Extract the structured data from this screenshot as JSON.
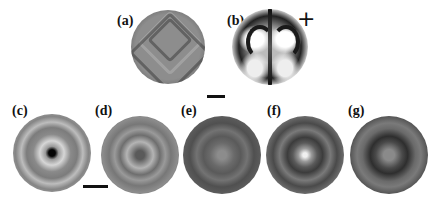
{
  "figure": {
    "panels": [
      {
        "id": "a",
        "label": "(a)",
        "description": "gray disc with nested diamond/chevron fringe pattern"
      },
      {
        "id": "b",
        "label": "(b)",
        "description": "high-contrast black and white disc with symmetric lobes",
        "marker": "+"
      },
      {
        "id": "c",
        "label": "(c)",
        "description": "concentric ring pattern with dark center, dark rim"
      },
      {
        "id": "d",
        "label": "(d)",
        "description": "concentric ring pattern, gray"
      },
      {
        "id": "e",
        "label": "(e)",
        "description": "faint concentric rings, dark gray"
      },
      {
        "id": "f",
        "label": "(f)",
        "description": "concentric rings with bright central spot"
      },
      {
        "id": "g",
        "label": "(g)",
        "description": "concentric dark ring around gray center"
      }
    ],
    "scale_bars": [
      {
        "id": "top",
        "near": "a-b"
      },
      {
        "id": "bottom",
        "near": "c-d"
      }
    ],
    "colors": {
      "background": "#ffffff",
      "text": "#111111"
    }
  }
}
